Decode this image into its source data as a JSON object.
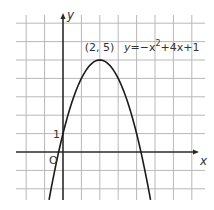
{
  "chart_data": {
    "type": "line",
    "title": "",
    "xlabel": "x",
    "ylabel": "y",
    "xlim": [
      -2.5,
      7.5
    ],
    "ylim": [
      -2.6,
      7.3
    ],
    "grid": true,
    "grid_step": 1,
    "series": [
      {
        "name": "y=-x^2+4x+1",
        "function": "-x^2+4x+1",
        "x": [
          -0.757,
          0,
          0.5,
          1,
          1.5,
          2,
          2.5,
          3,
          3.5,
          4,
          4.757
        ],
        "y": [
          -2.6,
          1,
          2.75,
          4,
          4.75,
          5,
          4.75,
          4,
          2.75,
          1,
          -2.6
        ]
      }
    ],
    "annotations": [
      {
        "text": "(2, 5)",
        "at": [
          2,
          5
        ],
        "kind": "vertex-label"
      },
      {
        "text": "1",
        "at": [
          0,
          1
        ],
        "kind": "y-intercept-label"
      },
      {
        "text": "O",
        "at": [
          0,
          0
        ],
        "kind": "origin-label"
      }
    ],
    "equation_label": {
      "prefix": "y",
      "middle": "=−x",
      "exponent": "2",
      "suffix": "+4x+1"
    }
  }
}
